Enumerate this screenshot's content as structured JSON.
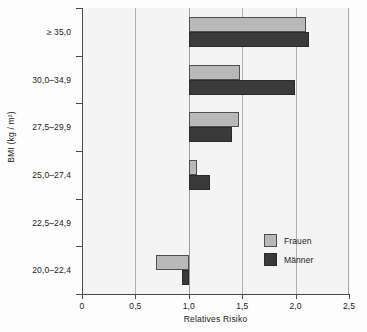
{
  "chart_data": {
    "type": "bar",
    "orientation": "horizontal",
    "title": "",
    "xlabel": "Relatives Risiko",
    "ylabel": "BMI (kg / m²)",
    "xlim": [
      0,
      2.5
    ],
    "x_ticks": [
      {
        "value": 0,
        "label": "0"
      },
      {
        "value": 0.5,
        "label": "0,5"
      },
      {
        "value": 1.0,
        "label": "1,0"
      },
      {
        "value": 1.5,
        "label": "1,5"
      },
      {
        "value": 2.0,
        "label": "2,0"
      },
      {
        "value": 2.5,
        "label": "2,5"
      }
    ],
    "grid": true,
    "gridlines": [
      0.5,
      1.0,
      1.5,
      2.0
    ],
    "baseline": 1.0,
    "legend_position": "lower-right",
    "categories": [
      "≥ 35,0",
      "30,0–34,9",
      "27,5–29,9",
      "25,0–27,4",
      "22,5–24,9",
      "20,0–22,4"
    ],
    "series": [
      {
        "name": "Frauen",
        "color": "#b9b9b9",
        "values": [
          2.1,
          1.48,
          1.47,
          1.08,
          1.0,
          0.69
        ]
      },
      {
        "name": "Männer",
        "color": "#3a3a3a",
        "values": [
          2.13,
          1.99,
          1.4,
          1.2,
          1.0,
          0.94
        ]
      }
    ]
  },
  "legend": {
    "items": [
      {
        "label": "Frauen"
      },
      {
        "label": "Männer"
      }
    ]
  }
}
